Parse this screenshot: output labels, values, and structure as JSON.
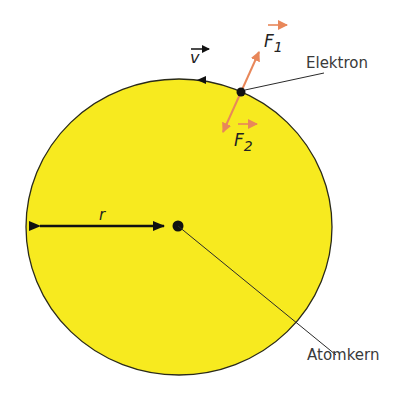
{
  "diagram": {
    "colors": {
      "orbit_fill": "#f7ea1f",
      "orbit_stroke": "#2a2a1a",
      "force_arrow": "#e8875a",
      "ink": "#111111",
      "label_text": "#3a3a3a"
    },
    "labels": {
      "electron": "Elektron",
      "nucleus": "Atomkern",
      "radius": "r",
      "velocity": "v",
      "force1": "F",
      "force1_sub": "1",
      "force2": "F",
      "force2_sub": "2"
    }
  }
}
